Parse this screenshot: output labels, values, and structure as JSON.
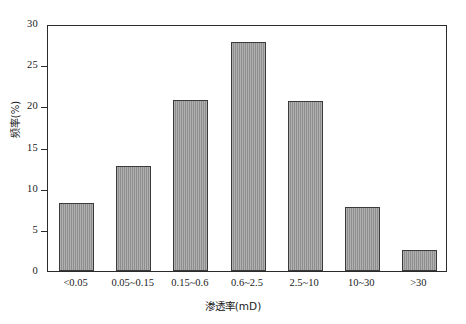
{
  "chart_data": {
    "type": "bar",
    "title": "",
    "xlabel": "渗透率(mD)",
    "ylabel": "频率(%)",
    "categories": [
      "<0.05",
      "0.05~0.15",
      "0.15~0.6",
      "0.6~2.5",
      "2.5~10",
      "10~30",
      ">30"
    ],
    "values": [
      8.3,
      12.7,
      20.8,
      27.8,
      20.7,
      7.8,
      2.5
    ],
    "ylim": [
      0,
      30
    ],
    "yticks": [
      0,
      5,
      10,
      15,
      20,
      25,
      30
    ],
    "ytick_labels": [
      "0",
      "5",
      "10",
      "15",
      "20",
      "25",
      "30"
    ],
    "grid": false,
    "legend": false,
    "bar_color": "#8e8e8e",
    "bar_edge_color": "#3a3a3a",
    "axis_color": "#2b2b2b",
    "background": "#ffffff"
  }
}
